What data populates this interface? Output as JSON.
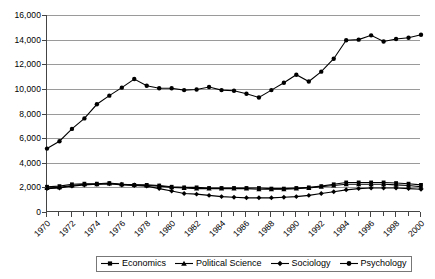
{
  "chart_data": {
    "type": "line",
    "title": "",
    "xlabel": "",
    "ylabel": "",
    "x": [
      1970,
      1971,
      1972,
      1973,
      1974,
      1975,
      1976,
      1977,
      1978,
      1979,
      1980,
      1981,
      1982,
      1983,
      1984,
      1985,
      1986,
      1987,
      1988,
      1989,
      1990,
      1991,
      1992,
      1993,
      1994,
      1995,
      1996,
      1997,
      1998,
      1999,
      2000
    ],
    "xlim": [
      1970,
      2000
    ],
    "ylim": [
      0,
      16000
    ],
    "ytick_values": [
      0,
      2000,
      4000,
      6000,
      8000,
      10000,
      12000,
      14000,
      16000
    ],
    "ytick_labels": [
      "0",
      "2,000",
      "4,000",
      "6,000",
      "8,000",
      "10,000",
      "12,000",
      "14,000",
      "16,000"
    ],
    "xtick_labels": [
      "1970",
      "1972",
      "1974",
      "1976",
      "1978",
      "1980",
      "1982",
      "1984",
      "1986",
      "1988",
      "1990",
      "1992",
      "1994",
      "1996",
      "1998",
      "2000"
    ],
    "xtick_values": [
      1970,
      1972,
      1974,
      1976,
      1978,
      1980,
      1982,
      1984,
      1986,
      1988,
      1990,
      1992,
      1994,
      1996,
      1998,
      2000
    ],
    "xtick_rotation_deg": -45,
    "grid": "horizontal",
    "legend_position": "bottom",
    "series": [
      {
        "name": "Economics",
        "marker": "square",
        "values": [
          2050,
          2100,
          2250,
          2300,
          2300,
          2350,
          2250,
          2200,
          2200,
          2150,
          2050,
          2000,
          2000,
          1950,
          1950,
          1950,
          1950,
          1950,
          1900,
          1900,
          1950,
          2000,
          2100,
          2250,
          2400,
          2400,
          2400,
          2400,
          2350,
          2300,
          2200
        ]
      },
      {
        "name": "Political Science",
        "marker": "triangle",
        "values": [
          1950,
          2000,
          2150,
          2250,
          2250,
          2300,
          2250,
          2200,
          2150,
          2100,
          2000,
          1950,
          1900,
          1900,
          1900,
          1900,
          1900,
          1850,
          1850,
          1850,
          1900,
          1950,
          2050,
          2150,
          2250,
          2250,
          2250,
          2250,
          2200,
          2150,
          2050
        ]
      },
      {
        "name": "Sociology",
        "marker": "diamond",
        "values": [
          1900,
          1950,
          2100,
          2200,
          2250,
          2300,
          2200,
          2150,
          2100,
          1900,
          1700,
          1500,
          1450,
          1350,
          1250,
          1200,
          1150,
          1150,
          1150,
          1200,
          1250,
          1350,
          1500,
          1650,
          1800,
          1900,
          1950,
          1950,
          1950,
          1900,
          1850
        ]
      },
      {
        "name": "Psychology",
        "marker": "circle",
        "values": [
          5150,
          5750,
          6750,
          7600,
          8750,
          9450,
          10100,
          10800,
          10250,
          10050,
          10050,
          9900,
          9950,
          10150,
          9900,
          9850,
          9600,
          9300,
          9900,
          10500,
          11150,
          10600,
          11400,
          12450,
          13950,
          14000,
          14350,
          13850,
          14050,
          14150,
          14400
        ]
      }
    ]
  },
  "legend": {
    "items": [
      {
        "label": "Economics",
        "marker": "square"
      },
      {
        "label": "Political Science",
        "marker": "triangle"
      },
      {
        "label": "Sociology",
        "marker": "diamond"
      },
      {
        "label": "Psychology",
        "marker": "circle"
      }
    ]
  }
}
